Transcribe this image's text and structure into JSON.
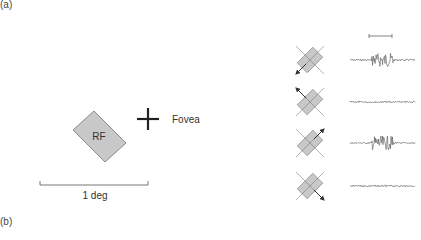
{
  "panels": {
    "a_label": "(a)",
    "b_label": "(b)"
  },
  "receptive_field": {
    "label": "RF",
    "fill": "#c8c8c8",
    "stroke": "#8a8a8a"
  },
  "fovea": {
    "label": "Fovea",
    "marker": "cross"
  },
  "scale_bar": {
    "label": "1 deg"
  },
  "stimulus_rows": [
    {
      "motion_direction": "down-left",
      "response": "burst"
    },
    {
      "motion_direction": "up-left",
      "response": "none"
    },
    {
      "motion_direction": "up-right",
      "response": "burst"
    },
    {
      "motion_direction": "down-right",
      "response": "none"
    }
  ],
  "time_scale_bar": {
    "label": ""
  },
  "colors": {
    "trace": "#555555",
    "icon_fill": "#c8c8c8",
    "icon_line": "#9a9a9a",
    "text": "#333333"
  }
}
